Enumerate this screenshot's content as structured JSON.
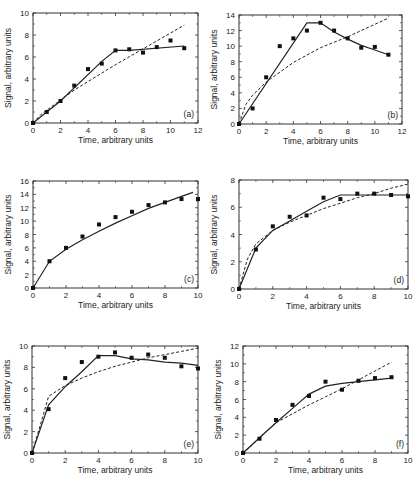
{
  "figure": {
    "xlabel": "Time, arbitrary units",
    "ylabel": "Signal, arbitrary units"
  },
  "chart_data": [
    {
      "type": "scatter",
      "panel": "(a)",
      "title": "",
      "xlabel": "Time, arbitrary units",
      "ylabel": "Signal, arbitrary units",
      "xlim": [
        0,
        12
      ],
      "ylim": [
        0,
        10
      ],
      "xticks": [
        0,
        2,
        4,
        6,
        8,
        10,
        12
      ],
      "yticks": [
        0,
        2,
        4,
        6,
        8,
        10
      ],
      "grid": false,
      "box": {
        "left": 33,
        "top": 13,
        "right": 198,
        "bottom": 123
      },
      "points": {
        "x": [
          0,
          1,
          2,
          3,
          4,
          5,
          6,
          7,
          8,
          9,
          10,
          11
        ],
        "y": [
          0,
          1.0,
          2.0,
          3.4,
          4.9,
          5.4,
          6.6,
          6.7,
          6.4,
          6.9,
          7.5,
          6.8
        ]
      },
      "series": [
        {
          "name": "solid-fit",
          "style": "solid",
          "x": [
            0,
            2,
            5,
            6,
            7,
            11
          ],
          "y": [
            0,
            2.0,
            5.6,
            6.6,
            6.6,
            7.0
          ]
        },
        {
          "name": "dashed-fit",
          "style": "dashed",
          "x": [
            0,
            0.6,
            3,
            6,
            11
          ],
          "y": [
            0,
            0.8,
            3.0,
            5.3,
            8.9
          ]
        }
      ]
    },
    {
      "type": "scatter",
      "panel": "(b)",
      "title": "",
      "xlabel": "Time, arbitrary units",
      "ylabel": "Signal, arbitrary units",
      "xlim": [
        0,
        12
      ],
      "ylim": [
        0,
        14
      ],
      "xticks": [
        0,
        2,
        4,
        6,
        8,
        10,
        12
      ],
      "yticks": [
        0,
        2,
        4,
        6,
        8,
        10,
        12,
        14
      ],
      "grid": false,
      "box": {
        "left": 239,
        "top": 15,
        "right": 402,
        "bottom": 124
      },
      "points": {
        "x": [
          0,
          1,
          2,
          3,
          4,
          5,
          6,
          7,
          8,
          9,
          10,
          11
        ],
        "y": [
          0,
          2.0,
          6.0,
          10.0,
          11.0,
          12.0,
          13.0,
          12.0,
          11.0,
          9.8,
          9.9,
          8.9
        ]
      },
      "series": [
        {
          "name": "solid-fit",
          "style": "solid",
          "x": [
            0,
            5,
            6,
            7,
            8,
            9,
            10,
            11
          ],
          "y": [
            0,
            13.0,
            13.0,
            11.8,
            10.9,
            10.1,
            9.5,
            8.9
          ]
        },
        {
          "name": "dashed-fit",
          "style": "dashed",
          "x": [
            0,
            0.5,
            1,
            2,
            4,
            6,
            8,
            11
          ],
          "y": [
            0,
            2.5,
            3.7,
            5.4,
            7.9,
            9.8,
            11.2,
            13.6
          ]
        }
      ]
    },
    {
      "type": "scatter",
      "panel": "(c)",
      "title": "",
      "xlabel": "Time, arbitrary units",
      "ylabel": "Signal, arbitrary units",
      "xlim": [
        0,
        10
      ],
      "ylim": [
        0,
        16
      ],
      "xticks": [
        0,
        2,
        4,
        6,
        8,
        10
      ],
      "yticks": [
        0,
        2,
        4,
        6,
        8,
        10,
        12,
        14,
        16
      ],
      "grid": false,
      "box": {
        "left": 33,
        "top": 181,
        "right": 198,
        "bottom": 288
      },
      "points": {
        "x": [
          0,
          1,
          2,
          3,
          4,
          5,
          6,
          7,
          8,
          9,
          10
        ],
        "y": [
          0,
          4.0,
          6.0,
          7.7,
          9.5,
          10.6,
          11.4,
          12.4,
          12.8,
          13.3,
          13.3
        ]
      },
      "series": [
        {
          "name": "solid-fit",
          "style": "solid",
          "x": [
            0,
            1,
            2,
            3,
            4,
            5,
            6,
            7,
            8,
            9,
            9.7
          ],
          "y": [
            0,
            4.0,
            5.8,
            7.2,
            8.5,
            9.7,
            10.8,
            11.9,
            12.8,
            13.7,
            14.3
          ]
        }
      ]
    },
    {
      "type": "scatter",
      "panel": "(d)",
      "title": "",
      "xlabel": "Time, arbitrary units",
      "ylabel": "Signal, arbitrary units",
      "xlim": [
        0,
        10
      ],
      "ylim": [
        0,
        8
      ],
      "xticks": [
        0,
        2,
        4,
        6,
        8,
        10
      ],
      "yticks": [
        0,
        2,
        4,
        6,
        8
      ],
      "grid": false,
      "box": {
        "left": 239,
        "top": 180,
        "right": 408,
        "bottom": 289
      },
      "points": {
        "x": [
          0,
          1,
          2,
          3,
          4,
          5,
          6,
          7,
          8,
          9,
          10
        ],
        "y": [
          0,
          2.9,
          4.6,
          5.3,
          5.4,
          6.7,
          6.6,
          7.0,
          7.0,
          6.9,
          6.8
        ]
      },
      "series": [
        {
          "name": "solid-fit",
          "style": "solid",
          "x": [
            0,
            1,
            2,
            3,
            4,
            5,
            6,
            7,
            8,
            9,
            10
          ],
          "y": [
            0,
            3.0,
            4.3,
            5.0,
            5.7,
            6.4,
            6.9,
            6.9,
            6.9,
            6.9,
            6.9
          ]
        },
        {
          "name": "dashed-fit",
          "style": "dashed",
          "x": [
            0,
            0.5,
            1,
            2,
            3,
            4,
            5,
            6,
            7,
            8,
            9,
            10
          ],
          "y": [
            0,
            2.2,
            3.3,
            4.3,
            4.9,
            5.4,
            5.9,
            6.3,
            6.7,
            7.0,
            7.4,
            7.7
          ]
        }
      ]
    },
    {
      "type": "scatter",
      "panel": "(e)",
      "title": "",
      "xlabel": "Time, arbitrary units",
      "ylabel": "Signal, arbitrary units",
      "xlim": [
        0,
        10
      ],
      "ylim": [
        0,
        10
      ],
      "xticks": [
        0,
        2,
        4,
        6,
        8,
        10
      ],
      "yticks": [
        0,
        2,
        4,
        6,
        8,
        10
      ],
      "grid": false,
      "box": {
        "left": 32,
        "top": 346,
        "right": 198,
        "bottom": 453
      },
      "points": {
        "x": [
          0,
          1,
          2,
          3,
          4,
          5,
          6,
          7,
          8,
          9,
          10
        ],
        "y": [
          0,
          4.1,
          7.0,
          8.5,
          9.0,
          9.4,
          8.9,
          9.2,
          8.9,
          8.1,
          7.9
        ]
      },
      "series": [
        {
          "name": "solid-fit",
          "style": "solid",
          "x": [
            0,
            1,
            2,
            3,
            4,
            5,
            6,
            7,
            8,
            9,
            10
          ],
          "y": [
            0,
            4.5,
            6.2,
            7.6,
            9.1,
            9.1,
            8.8,
            8.7,
            8.5,
            8.4,
            8.2
          ]
        },
        {
          "name": "dashed-fit",
          "style": "dashed",
          "x": [
            0,
            0.5,
            1,
            2,
            3,
            4,
            5,
            6,
            7,
            8,
            9,
            10
          ],
          "y": [
            0,
            2.6,
            5.3,
            6.3,
            7.0,
            7.6,
            8.1,
            8.5,
            8.9,
            9.2,
            9.5,
            9.8
          ]
        }
      ]
    },
    {
      "type": "scatter",
      "panel": "(f)",
      "title": "",
      "xlabel": "Time, arbitrary units",
      "ylabel": "Signal, arbitrary units",
      "xlim": [
        0,
        10
      ],
      "ylim": [
        0,
        12
      ],
      "xticks": [
        0,
        2,
        4,
        6,
        8,
        10
      ],
      "yticks": [
        0,
        2,
        4,
        6,
        8,
        10,
        12
      ],
      "grid": false,
      "box": {
        "left": 243,
        "top": 346,
        "right": 408,
        "bottom": 453
      },
      "points": {
        "x": [
          0,
          1,
          2,
          3,
          4,
          5,
          6,
          7,
          8,
          9
        ],
        "y": [
          0,
          1.6,
          3.7,
          5.4,
          6.4,
          8.0,
          7.1,
          8.1,
          8.4,
          8.5
        ]
      },
      "series": [
        {
          "name": "solid-fit",
          "style": "solid",
          "x": [
            0,
            1,
            2,
            3,
            4,
            5,
            6,
            7,
            8,
            9
          ],
          "y": [
            0,
            1.7,
            3.4,
            5.0,
            6.6,
            7.5,
            7.8,
            8.0,
            8.2,
            8.4
          ]
        },
        {
          "name": "dashed-fit",
          "style": "dashed",
          "x": [
            0,
            0.5,
            1,
            2,
            3,
            4,
            5,
            6,
            7,
            8,
            9
          ],
          "y": [
            0,
            0.8,
            1.7,
            3.4,
            4.4,
            5.4,
            6.3,
            7.2,
            8.2,
            9.2,
            10.2
          ]
        }
      ]
    }
  ]
}
